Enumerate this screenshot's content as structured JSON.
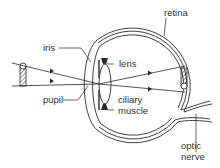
{
  "diagram": {
    "title": "",
    "colors": {
      "line": "#2a2a2a",
      "text": "#333333",
      "background": "#ffffff"
    },
    "labels": {
      "iris": "iris",
      "lens": "lens",
      "retina": "retina",
      "pupil": "pupil",
      "ciliary_muscle_line1": "ciliary",
      "ciliary_muscle_line2": "muscle",
      "optic_nerve_line1": "optic",
      "optic_nerve_line2": "nerve"
    },
    "elements": {
      "object": "hatched upright object (left)",
      "image": "hatched inverted image on retina (right)",
      "rays": "two light rays crossing at the pupil"
    }
  }
}
